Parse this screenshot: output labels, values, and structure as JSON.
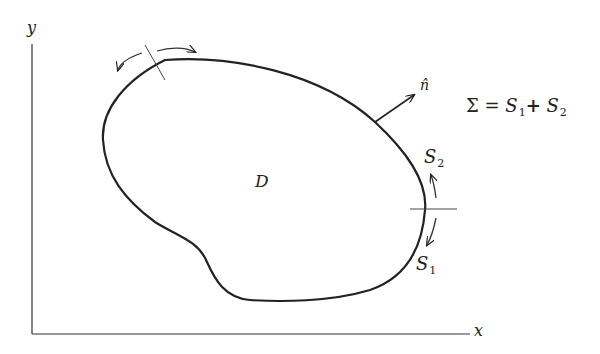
{
  "diagram": {
    "axes": {
      "x_label": "x",
      "y_label": "y"
    },
    "region_label": "D",
    "normal_label": "n̂",
    "surfaces": [
      {
        "name": "S",
        "sub": "1"
      },
      {
        "name": "S",
        "sub": "2"
      }
    ],
    "equation": {
      "lhs": "Σ",
      "equals": "=",
      "term1": "S",
      "term1_sub": "1",
      "plus": "+",
      "term2": "S",
      "term2_sub": "2"
    },
    "colors": {
      "stroke": "#222222",
      "background": "#ffffff"
    }
  }
}
